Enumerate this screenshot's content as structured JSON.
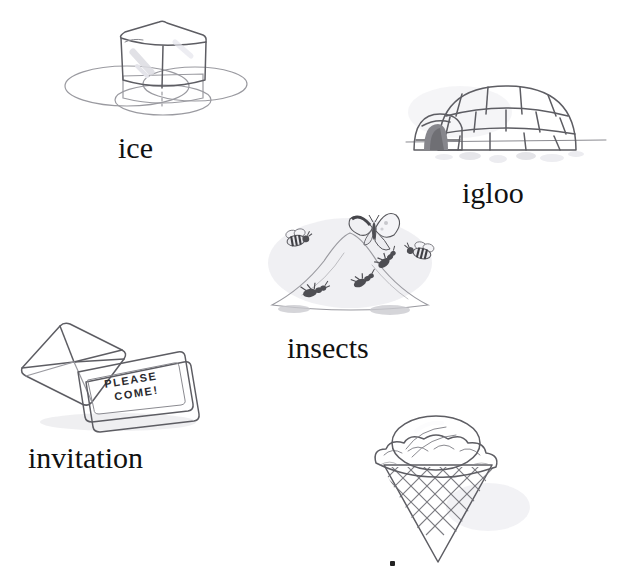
{
  "page": {
    "type": "illustrated-vocabulary-worksheet",
    "background_color": "#ffffff",
    "letter_theme": "i",
    "width": 618,
    "height": 565
  },
  "palette": {
    "ink": "#5d5d63",
    "ink_soft": "#9a9aa0",
    "caption_color": "#111111",
    "wash_grey": "#b9b9bd",
    "mound_grey": "#8e8e92",
    "card_grey": "#c9c9cb",
    "cone_grey": "#a8a8ac",
    "dark_opening": "#6f6f74"
  },
  "items": [
    {
      "id": "ice",
      "label": "ice",
      "illustration": "ice-cube-melting-in-puddle",
      "caption_x": 118,
      "caption_y": 133
    },
    {
      "id": "igloo",
      "label": "igloo",
      "illustration": "snow-block-dome-with-entrance-tunnel",
      "caption_x": 462,
      "caption_y": 178
    },
    {
      "id": "insects",
      "label": "insects",
      "illustration": "anthill-with-ants-bees-and-butterfly",
      "caption_x": 287,
      "caption_y": 333
    },
    {
      "id": "invitation",
      "label": "invitation",
      "illustration": "envelope-with-card",
      "caption_x": 28,
      "caption_y": 443
    },
    {
      "id": "ice-cream",
      "label": "",
      "illustration": "waffle-cone-with-scoop",
      "caption_x": 0,
      "caption_y": 0
    }
  ],
  "invitation_card": {
    "line1": "PLEASE",
    "line2": "COME!"
  }
}
